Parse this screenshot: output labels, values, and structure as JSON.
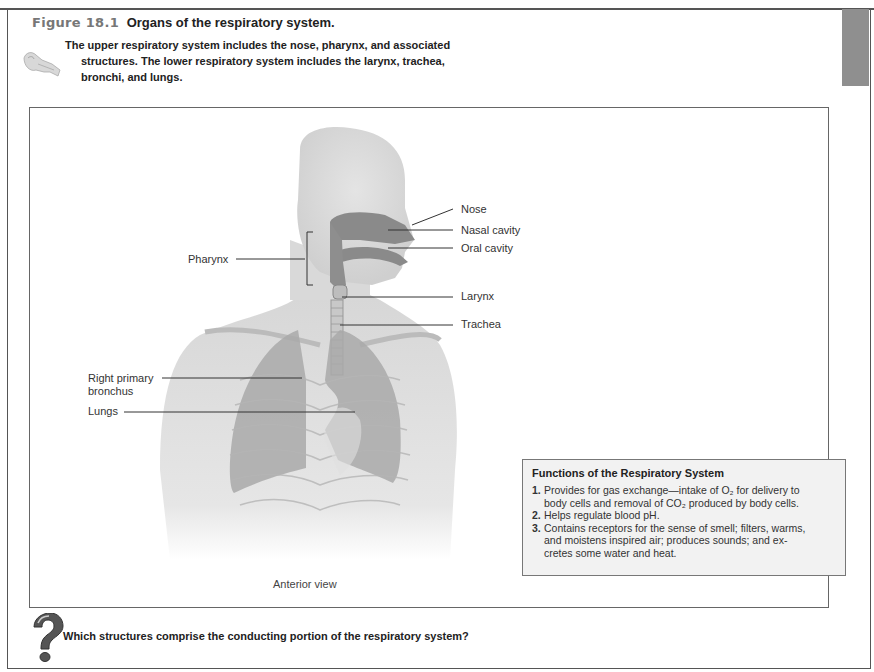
{
  "figure": {
    "number": "Figure 18.1",
    "title": "Organs of the respiratory system.",
    "intro_line1": "The upper respiratory system includes the nose, pharynx, and associated",
    "intro_line2": "structures. The lower respiratory system includes the larynx, trachea,",
    "intro_line3": "bronchi, and lungs.",
    "view_caption": "Anterior view"
  },
  "labels": {
    "nose": "Nose",
    "nasal_cavity": "Nasal cavity",
    "oral_cavity": "Oral cavity",
    "pharynx": "Pharynx",
    "larynx": "Larynx",
    "trachea": "Trachea",
    "right_primary_bronchus_l1": "Right primary",
    "right_primary_bronchus_l2": "bronchus",
    "lungs": "Lungs"
  },
  "functions_box": {
    "title": "Functions of the Respiratory System",
    "items": [
      {
        "n": "1.",
        "line1": "Provides for gas exchange—intake of O₂ for delivery to",
        "line2": "body cells and removal of CO₂ produced by body cells.",
        "line3": ""
      },
      {
        "n": "2.",
        "line1": "Helps regulate blood pH.",
        "line2": "",
        "line3": ""
      },
      {
        "n": "3.",
        "line1": "Contains receptors for the sense of smell; filters, warms,",
        "line2": "and moistens inspired air; produces sounds; and ex-",
        "line3": "cretes some water and heat."
      }
    ]
  },
  "question": {
    "icon": "question-mark-icon",
    "text": "Which structures comprise the conducting portion of the respiratory system?"
  },
  "icons": {
    "intro_icon": "key-icon"
  },
  "colors": {
    "figure_number": "#777777",
    "tab_block": "#8f8f8f",
    "functions_bg": "#f2f2f2"
  }
}
